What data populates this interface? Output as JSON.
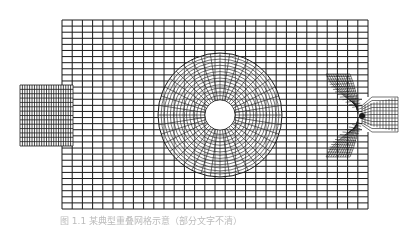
{
  "figure": {
    "stroke_color": "#1a1a1a",
    "background_grid": {
      "x0": 62,
      "y0": 20,
      "x1": 368,
      "y1": 209,
      "cols": 30,
      "rows": 31
    },
    "left_block": {
      "x0": 20,
      "y0": 85,
      "x1": 73,
      "y1": 146,
      "cols": 22,
      "rows": 14
    },
    "annulus": {
      "cx": 220,
      "cy": 115,
      "r_outer": 62,
      "r_inner": 15,
      "radial_lines": 40,
      "rings": 14
    },
    "junction": {
      "center": [
        362,
        116
      ],
      "right_arm": {
        "x0": 362,
        "y0": 97,
        "x1": 398,
        "y1": 132,
        "cols": 12,
        "rows": 10
      }
    }
  },
  "caption": {
    "text": "图 1.1  某典型重叠网格示意（部分文字不清）"
  }
}
